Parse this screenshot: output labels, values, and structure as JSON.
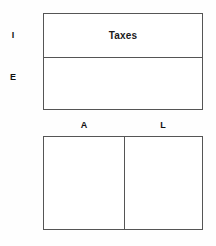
{
  "diagram": {
    "title": "",
    "background_color": "#fefefe",
    "border_color": "#555555",
    "text_color": "#111111",
    "top_box": {
      "rows": [
        {
          "side_label": "I",
          "cell_text": "Taxes"
        },
        {
          "side_label": "E",
          "cell_text": ""
        }
      ]
    },
    "bottom_box": {
      "columns": [
        {
          "header": "A",
          "cell_text": ""
        },
        {
          "header": "L",
          "cell_text": ""
        }
      ]
    }
  }
}
